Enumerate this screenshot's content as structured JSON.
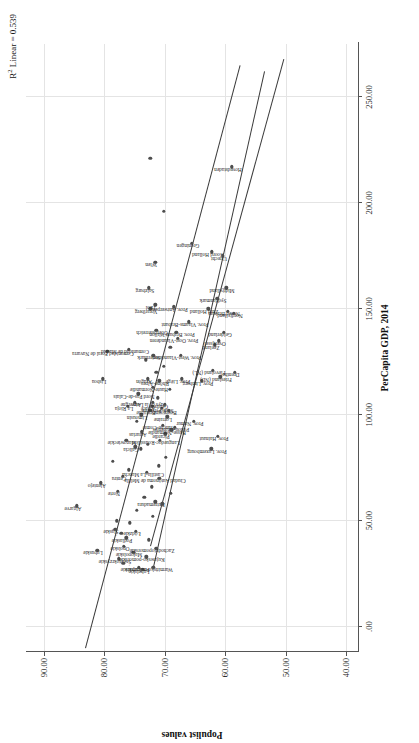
{
  "chart_data": {
    "type": "scatter",
    "title": "",
    "xlabel": "PerCapita GDP, 2014",
    "ylabel": "Populist values",
    "annotation": "R2 Linear = 0.539",
    "annotation_prefix": "R",
    "annotation_sup": "2",
    "annotation_suffix": " Linear = 0.539",
    "xlim": [
      -12,
      275
    ],
    "ylim": [
      38,
      93
    ],
    "xticks": [
      ".00",
      "50.00",
      "100.00",
      "150.00",
      "200.00",
      "250.00"
    ],
    "xtick_values": [
      0,
      50,
      100,
      150,
      200,
      250
    ],
    "yticks": [
      "90.00",
      "80.00",
      "70.00",
      "60.00",
      "50.00",
      "40.00"
    ],
    "ytick_values": [
      90,
      80,
      70,
      60,
      50,
      40
    ],
    "grid": true,
    "legend": "none",
    "fit_lines": [
      {
        "name": "regression-line",
        "x1": -10,
        "y1": 83.2,
        "x2": 265,
        "y2": 57.6
      },
      {
        "name": "confidence-upper",
        "x1": 28,
        "y1": 72.0,
        "x2": 262,
        "y2": 53.6
      },
      {
        "name": "confidence-lower",
        "x1": 38,
        "y1": 72.4,
        "x2": 268,
        "y2": 50.3
      }
    ],
    "points": [
      {
        "label": "Algarve",
        "x": 57,
        "y": 84.6
      },
      {
        "label": "Lubuskie",
        "x": 36,
        "y": 81.2
      },
      {
        "label": "Alentejo",
        "x": 68,
        "y": 80.6
      },
      {
        "label": "Lisboa",
        "x": 117,
        "y": 80.3
      },
      {
        "label": "Comunidad Foral de Navarra",
        "x": 130,
        "y": 79.5
      },
      {
        "label": "Śląskie",
        "x": 46,
        "y": 78.2
      },
      {
        "label": "Świętokrzyskie",
        "x": 32,
        "y": 77.6
      },
      {
        "label": "Norte",
        "x": 64,
        "y": 77.8
      },
      {
        "label": "Centru",
        "x": 71,
        "y": 77.0
      },
      {
        "label": "Opolskie",
        "x": 38,
        "y": 76.8
      },
      {
        "label": "Podlaskie",
        "x": 42,
        "y": 76.4
      },
      {
        "label": "Mazowieckie",
        "x": 88,
        "y": 76.4
      },
      {
        "label": "La Rioja",
        "x": 104,
        "y": 76.1
      },
      {
        "label": "Comunidad de Madrid",
        "x": 131,
        "y": 76.0
      },
      {
        "label": "Małopolskie",
        "x": 35,
        "y": 75.2
      },
      {
        "label": "Podkarpackie",
        "x": 28,
        "y": 74.3
      },
      {
        "label": "Łódzkie",
        "x": 45,
        "y": 74.8
      },
      {
        "label": "Galicia",
        "x": 85,
        "y": 74.9
      },
      {
        "label": "Auvergne",
        "x": 106,
        "y": 75.0
      },
      {
        "label": "Lubelskie",
        "x": 27,
        "y": 73.6
      },
      {
        "label": "Kujawsko-pomorskie",
        "x": 33,
        "y": 73.1
      },
      {
        "label": "Asturias",
        "x": 92,
        "y": 73.8
      },
      {
        "label": "Castilla-La Mancha",
        "x": 73,
        "y": 73.0
      },
      {
        "label": "Limousin",
        "x": 100,
        "y": 73.9
      },
      {
        "label": "Nord Pas-de-Calais",
        "x": 110,
        "y": 74.4
      },
      {
        "label": "Warmińsko-mazurskie",
        "x": 28,
        "y": 71.9
      },
      {
        "label": "Zachodniopomorskie",
        "x": 37,
        "y": 71.4
      },
      {
        "label": "Extremadura",
        "x": 59,
        "y": 71.6
      },
      {
        "label": "Ciudad Autónoma de Melilla",
        "x": 70,
        "y": 70.9
      },
      {
        "label": "Alsace",
        "x": 104,
        "y": 72.1
      },
      {
        "label": "Aragón",
        "x": 117,
        "y": 72.8
      },
      {
        "label": "Bretagne",
        "x": 102,
        "y": 72.4
      },
      {
        "label": "Pays de la Loire",
        "x": 106,
        "y": 72.0
      },
      {
        "label": "Haute-Normandie",
        "x": 113,
        "y": 72.0
      },
      {
        "label": "Languedoc-Roussillon",
        "x": 88,
        "y": 70.8
      },
      {
        "label": "Franche-Comté",
        "x": 95,
        "y": 70.3
      },
      {
        "label": "Picardie",
        "x": 91,
        "y": 69.9
      },
      {
        "label": "Midi-Pyrénées",
        "x": 103,
        "y": 70.5
      },
      {
        "label": "Centre",
        "x": 105,
        "y": 70.0
      },
      {
        "label": "Rhône-Alpes",
        "x": 116,
        "y": 70.9
      },
      {
        "label": "Basse-Normandie",
        "x": 93,
        "y": 68.9
      },
      {
        "label": "Poitou-Charentes",
        "x": 94,
        "y": 68.3
      },
      {
        "label": "Bourgogne",
        "x": 102,
        "y": 69.3
      },
      {
        "label": "Lorraine",
        "x": 99,
        "y": 69.6
      },
      {
        "label": "Steiermark",
        "x": 128,
        "y": 71.9
      },
      {
        "label": "Oberösterreich",
        "x": 140,
        "y": 71.4
      },
      {
        "label": "Vorarlberg",
        "x": 150,
        "y": 72.4
      },
      {
        "label": "Salzburg",
        "x": 160,
        "y": 72.7
      },
      {
        "label": "Tirol",
        "x": 152,
        "y": 71.6
      },
      {
        "label": "Wien",
        "x": 172,
        "y": 71.6
      },
      {
        "label": "Prov. Brabant Wallon",
        "x": 139,
        "y": 68.1
      },
      {
        "label": "Prov. Liège",
        "x": 117,
        "y": 67.2
      },
      {
        "label": "Prov. Namur",
        "x": 97,
        "y": 65.2
      },
      {
        "label": "Prov. Luxembourg",
        "x": 84,
        "y": 62.3
      },
      {
        "label": "Prov. Hainaut",
        "x": 90,
        "y": 61.2
      },
      {
        "label": "Prov. West-Vlaanderen",
        "x": 128,
        "y": 67.4
      },
      {
        "label": "Prov. Oost-Vlaanderen",
        "x": 136,
        "y": 67.9
      },
      {
        "label": "Prov. Antwerpen",
        "x": 151,
        "y": 68.5
      },
      {
        "label": "Prov. Vlaams-Brabant",
        "x": 144,
        "y": 66.0
      },
      {
        "label": "Prov. Limburg",
        "x": 116,
        "y": 63.9
      },
      {
        "label": "Flevoland (NL)",
        "x": 121,
        "y": 62.1
      },
      {
        "label": "Zeeland",
        "x": 133,
        "y": 61.7
      },
      {
        "label": "Friesland (NL)",
        "x": 118,
        "y": 60.8
      },
      {
        "label": "Drenthe",
        "x": 120,
        "y": 58.4
      },
      {
        "label": "Overijssel",
        "x": 135,
        "y": 61.1
      },
      {
        "label": "Gelderland",
        "x": 139,
        "y": 60.2
      },
      {
        "label": "Groningen",
        "x": 181,
        "y": 65.5
      },
      {
        "label": "Zuid Holland",
        "x": 150,
        "y": 62.8
      },
      {
        "label": "Noord Brabant",
        "x": 149,
        "y": 59.6
      },
      {
        "label": "Noord Holland",
        "x": 177,
        "y": 62.2
      },
      {
        "label": "Utrecht",
        "x": 175,
        "y": 60.4
      },
      {
        "label": "Syddanmark",
        "x": 155,
        "y": 61.3
      },
      {
        "label": "Midtjylland",
        "x": 160,
        "y": 59.8
      },
      {
        "label": "Nordjylland",
        "x": 148,
        "y": 58.6
      },
      {
        "label": "Hovedstaden",
        "x": 217,
        "y": 58.9
      },
      {
        "label": "",
        "x": 196,
        "y": 70.2
      },
      {
        "label": "",
        "x": 221,
        "y": 72.4
      },
      {
        "label": "",
        "x": 78,
        "y": 78.6
      },
      {
        "label": "",
        "x": 49,
        "y": 75.8
      },
      {
        "label": "",
        "x": 55,
        "y": 74.6
      },
      {
        "label": "",
        "x": 61,
        "y": 73.4
      },
      {
        "label": "",
        "x": 66,
        "y": 72.2
      },
      {
        "label": "",
        "x": 76,
        "y": 71.0
      },
      {
        "label": "",
        "x": 80,
        "y": 69.8
      },
      {
        "label": "",
        "x": 84,
        "y": 74.0
      },
      {
        "label": "",
        "x": 97,
        "y": 74.6
      },
      {
        "label": "",
        "x": 108,
        "y": 71.2
      },
      {
        "label": "",
        "x": 112,
        "y": 69.2
      },
      {
        "label": "",
        "x": 86,
        "y": 72.8
      },
      {
        "label": "",
        "x": 74,
        "y": 76.0
      },
      {
        "label": "",
        "x": 41,
        "y": 72.7
      },
      {
        "label": "",
        "x": 52,
        "y": 72.0
      },
      {
        "label": "",
        "x": 58,
        "y": 70.4
      },
      {
        "label": "",
        "x": 63,
        "y": 69.0
      },
      {
        "label": "",
        "x": 123,
        "y": 70.2
      },
      {
        "label": "",
        "x": 126,
        "y": 73.2
      },
      {
        "label": "",
        "x": 120,
        "y": 71.4
      },
      {
        "label": "",
        "x": 132,
        "y": 69.1
      },
      {
        "label": "",
        "x": 30,
        "y": 76.9
      },
      {
        "label": "",
        "x": 44,
        "y": 77.2
      },
      {
        "label": "",
        "x": 50,
        "y": 78.0
      }
    ]
  }
}
